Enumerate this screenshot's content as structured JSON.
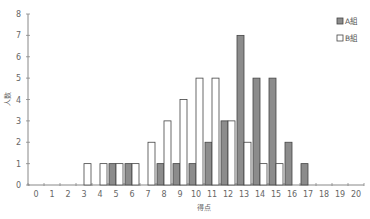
{
  "chart_data": {
    "type": "bar",
    "title": "",
    "xlabel": "得点",
    "ylabel": "人数",
    "categories": [
      "0",
      "1",
      "2",
      "3",
      "4",
      "5",
      "6",
      "7",
      "8",
      "9",
      "10",
      "11",
      "12",
      "13",
      "14",
      "15",
      "16",
      "17",
      "18",
      "19",
      "20"
    ],
    "series": [
      {
        "name": "A組",
        "color": "#8c8c8c",
        "values": [
          0,
          0,
          0,
          0,
          0,
          1,
          1,
          0,
          1,
          1,
          1,
          2,
          3,
          7,
          5,
          5,
          2,
          1,
          0,
          0,
          0
        ]
      },
      {
        "name": "B組",
        "color": "#ffffff",
        "values": [
          0,
          0,
          0,
          1,
          1,
          1,
          1,
          2,
          3,
          4,
          5,
          5,
          3,
          2,
          1,
          1,
          0,
          0,
          0,
          0,
          0
        ]
      }
    ],
    "ylim": [
      0,
      8
    ],
    "yticks": [
      0,
      1,
      2,
      3,
      4,
      5,
      6,
      7,
      8
    ],
    "grid": false,
    "legend_position": "top-right"
  },
  "legend": {
    "a_label": "A組",
    "b_label": "B組"
  },
  "axes": {
    "x_title": "得点",
    "y_title": "人数"
  }
}
